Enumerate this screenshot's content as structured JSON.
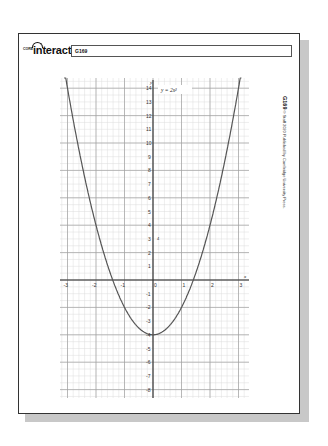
{
  "header": {
    "logo_prefix": "CORE",
    "logo_text": "interact",
    "title": "G169"
  },
  "side_caption": {
    "code": "G169",
    "text": "© Staff 2020  Published by Cambridge University Press."
  },
  "graph": {
    "equation_label": "y = 2x²",
    "point_label": "4",
    "x_axis_label": "x",
    "y_axis_label": "y",
    "x_ticks": [
      "-3",
      "-2",
      "-1",
      "0",
      "1",
      "2",
      "3"
    ],
    "y_ticks": [
      "14",
      "13",
      "12",
      "11",
      "10",
      "9",
      "8",
      "7",
      "6",
      "5",
      "4",
      "3",
      "2",
      "1",
      "-1",
      "-2",
      "-3",
      "-4",
      "-5",
      "-6",
      "-7",
      "-8"
    ]
  },
  "chart_data": {
    "type": "line",
    "title": "",
    "equation": "y = 2x^2 - 4",
    "label_shown": "y = 2x²",
    "xlabel": "x",
    "ylabel": "y",
    "xlim": [
      -3.3,
      3.3
    ],
    "ylim": [
      -8.7,
      14.7
    ],
    "grid": true,
    "series": [
      {
        "name": "y = 2x² − 4",
        "x": [
          -3.1,
          -3,
          -2.5,
          -2,
          -1.5,
          -1.414,
          -1,
          -0.5,
          0,
          0.5,
          1,
          1.414,
          1.5,
          2,
          2.5,
          3,
          3.1
        ],
        "y": [
          15.22,
          14,
          8.5,
          4,
          0.5,
          0,
          -2,
          -3.5,
          -4,
          -3.5,
          -2,
          0,
          0.5,
          4,
          8.5,
          14,
          15.22
        ]
      }
    ],
    "colors": {
      "curve": "#555555",
      "grid_major": "#9a9a9a",
      "grid_minor": "#d8d8d8",
      "axes": "#333333"
    }
  }
}
